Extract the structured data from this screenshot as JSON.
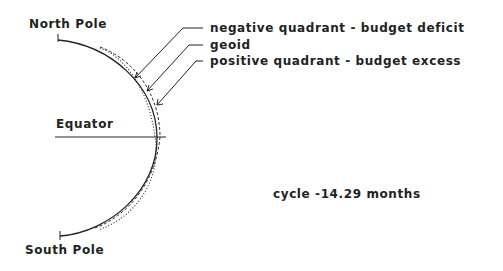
{
  "labels": {
    "north_pole": "North Pole",
    "south_pole": "South Pole",
    "equator": "Equator",
    "cycle": "cycle -14.29 months"
  },
  "legend": [
    {
      "label": "negative quadrant - budget deficit",
      "style": "dashed"
    },
    {
      "label": "geoid",
      "style": "solid"
    },
    {
      "label": "positive quadrant - budget excess",
      "style": "dotted"
    }
  ],
  "colors": {
    "line": "#222222",
    "background": "#ffffff"
  }
}
